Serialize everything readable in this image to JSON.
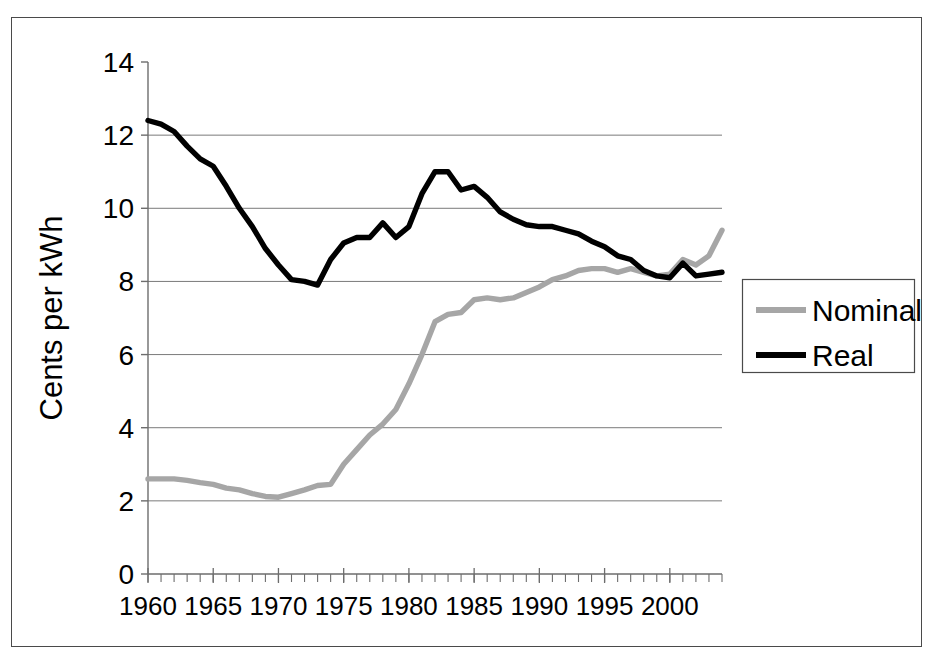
{
  "chart_data": {
    "type": "line",
    "title": "",
    "xlabel": "",
    "ylabel": "Cents per kWh",
    "xlim": [
      1960,
      2004
    ],
    "ylim": [
      0,
      14
    ],
    "ytick_labels": [
      "0",
      "2",
      "4",
      "6",
      "8",
      "10",
      "12",
      "14"
    ],
    "yticks": [
      0,
      2,
      4,
      6,
      8,
      10,
      12,
      14
    ],
    "xtick_labels": [
      "1960",
      "1965",
      "1970",
      "1975",
      "1980",
      "1985",
      "1990",
      "1995",
      "2000"
    ],
    "xticks": [
      1960,
      1965,
      1970,
      1975,
      1980,
      1985,
      1990,
      1995,
      2000
    ],
    "minor_xtick_interval": 1,
    "grid": "horizontal",
    "legend_position": "right-outside",
    "x": [
      1960,
      1961,
      1962,
      1963,
      1964,
      1965,
      1966,
      1967,
      1968,
      1969,
      1970,
      1971,
      1972,
      1973,
      1974,
      1975,
      1976,
      1977,
      1978,
      1979,
      1980,
      1981,
      1982,
      1983,
      1984,
      1985,
      1986,
      1987,
      1988,
      1989,
      1990,
      1991,
      1992,
      1993,
      1994,
      1995,
      1996,
      1997,
      1998,
      1999,
      2000,
      2001,
      2002,
      2003,
      2004
    ],
    "series": [
      {
        "name": "Nominal",
        "color": "#a6a6a6",
        "values": [
          2.6,
          2.6,
          2.6,
          2.56,
          2.5,
          2.45,
          2.35,
          2.3,
          2.2,
          2.12,
          2.1,
          2.2,
          2.3,
          2.42,
          2.45,
          3.0,
          3.4,
          3.8,
          4.1,
          4.5,
          5.2,
          6.0,
          6.9,
          7.1,
          7.15,
          7.5,
          7.55,
          7.5,
          7.55,
          7.7,
          7.85,
          8.05,
          8.15,
          8.3,
          8.35,
          8.35,
          8.25,
          8.35,
          8.25,
          8.15,
          8.2,
          8.6,
          8.45,
          8.7,
          9.4
        ]
      },
      {
        "name": "Real",
        "color": "#000000",
        "values": [
          12.4,
          12.3,
          12.1,
          11.7,
          11.35,
          11.15,
          10.6,
          10.0,
          9.5,
          8.9,
          8.45,
          8.05,
          8.0,
          7.9,
          8.6,
          9.05,
          9.2,
          9.2,
          9.6,
          9.2,
          9.5,
          10.4,
          11.0,
          11.0,
          10.5,
          10.6,
          10.3,
          9.9,
          9.7,
          9.55,
          9.5,
          9.5,
          9.4,
          9.3,
          9.1,
          8.95,
          8.7,
          8.6,
          8.3,
          8.15,
          8.1,
          8.5,
          8.15,
          8.2,
          8.25
        ]
      }
    ],
    "legend": [
      {
        "label": "Nominal",
        "color": "#a6a6a6"
      },
      {
        "label": "Real",
        "color": "#000000"
      }
    ]
  },
  "axis": {
    "y_title": "Cents per kWh"
  }
}
